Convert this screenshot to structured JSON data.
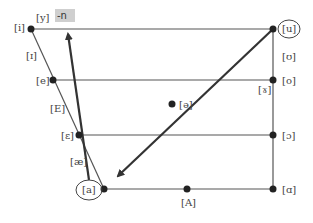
{
  "diagram": {
    "colors": {
      "line": "#444444",
      "arrow": "#333333",
      "dot": "#222222",
      "label": "#444444",
      "highlight_bg": "#cfcfcf"
    },
    "highlight_label": "-n",
    "vowels": {
      "i": "[i]",
      "y": "[y]",
      "u": "[u]",
      "I": "[ɪ]",
      "U": "[ʊ]",
      "e": "[e]",
      "o": "[o]",
      "gamma": "[ɤ]",
      "E_cap": "[E]",
      "schwa": "[ə]",
      "epsilon": "[ɛ]",
      "open_o": "[ɔ]",
      "ae": "[æ]",
      "a": "[a]",
      "A_cap": "[A]",
      "script_a": "[ɑ]"
    },
    "circled": [
      "[u]",
      "[a]"
    ],
    "arrows": [
      {
        "from": "[a]",
        "to": "-n",
        "description": "arrow from low front [a] up to -n"
      },
      {
        "from": "[u]",
        "to": "[a]",
        "description": "arrow from high back [u] down to [a]"
      }
    ]
  }
}
